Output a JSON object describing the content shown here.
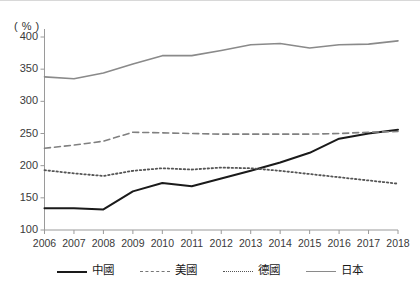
{
  "chart_data": {
    "type": "line",
    "title": "",
    "xlabel": "",
    "ylabel": "",
    "unit_label": "( % )",
    "x": [
      2006,
      2007,
      2008,
      2009,
      2010,
      2011,
      2012,
      2013,
      2014,
      2015,
      2016,
      2017,
      2018
    ],
    "categories": [
      "2006",
      "2007",
      "2008",
      "2009",
      "2010",
      "2011",
      "2012",
      "2013",
      "2014",
      "2015",
      "2016",
      "2017",
      "2018"
    ],
    "ylim": [
      100,
      400
    ],
    "yticks": [
      100,
      150,
      200,
      250,
      300,
      350,
      400
    ],
    "ytick_labels": [
      "100",
      "150",
      "200",
      "250",
      "300",
      "350",
      "400"
    ],
    "grid": false,
    "legend_position": "bottom",
    "series": [
      {
        "name": "中國",
        "style": "solid",
        "color": "#1a1a1a",
        "width": 2,
        "values": [
          134,
          134,
          132,
          160,
          173,
          168,
          180,
          192,
          205,
          220,
          242,
          250,
          256
        ]
      },
      {
        "name": "美國",
        "style": "dashed",
        "color": "#808080",
        "width": 1.6,
        "values": [
          227,
          232,
          238,
          252,
          251,
          250,
          249,
          249,
          249,
          249,
          250,
          252,
          253
        ]
      },
      {
        "name": "德國",
        "style": "dotted",
        "color": "#555555",
        "width": 1.8,
        "values": [
          193,
          188,
          184,
          192,
          196,
          194,
          197,
          196,
          192,
          187,
          182,
          177,
          172
        ]
      },
      {
        "name": "日本",
        "style": "solid",
        "color": "#8a8a8a",
        "width": 1.6,
        "values": [
          338,
          335,
          344,
          358,
          371,
          371,
          379,
          388,
          390,
          383,
          388,
          389,
          394
        ]
      }
    ]
  },
  "legend": {
    "items": [
      {
        "label": "中國",
        "swatch": "solid-dark"
      },
      {
        "label": "美國",
        "swatch": "dashed"
      },
      {
        "label": "德國",
        "swatch": "dotted"
      },
      {
        "label": "日本",
        "swatch": "solid-gray"
      }
    ]
  },
  "axes": {
    "unit": "( % )"
  }
}
